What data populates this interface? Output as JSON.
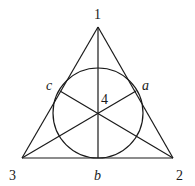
{
  "diagram": {
    "type": "fano-plane",
    "points": {
      "p1": {
        "label": "1",
        "x": 98,
        "y": 27
      },
      "p2": {
        "label": "2",
        "x": 173,
        "y": 158
      },
      "p3": {
        "label": "3",
        "x": 22,
        "y": 158
      },
      "p4": {
        "label": "4",
        "x": 98,
        "y": 113
      },
      "a": {
        "label": "a",
        "x": 136,
        "y": 91
      },
      "b": {
        "label": "b",
        "x": 98,
        "y": 158
      },
      "c": {
        "label": "c",
        "x": 60,
        "y": 91
      }
    },
    "circle": {
      "cx": 98,
      "cy": 113,
      "r": 45
    },
    "labels": {
      "one": "1",
      "two": "2",
      "three": "3",
      "four": "4",
      "a": "a",
      "b": "b",
      "c": "c"
    },
    "stroke_color": "#1a1a1a"
  }
}
